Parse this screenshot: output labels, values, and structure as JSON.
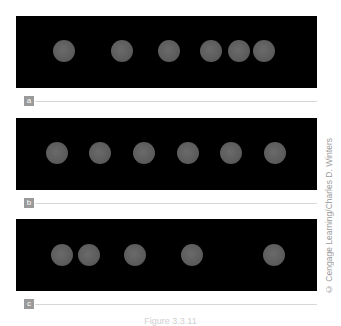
{
  "figure": {
    "panels": [
      {
        "label": "a",
        "top": 16,
        "coin_y": 35,
        "coins_x": [
          48,
          106,
          153,
          195,
          223,
          248
        ]
      },
      {
        "label": "b",
        "top": 118,
        "coin_y": 35,
        "coins_x": [
          41,
          84,
          128,
          172,
          215,
          259
        ]
      },
      {
        "label": "c",
        "top": 219,
        "coin_y": 36,
        "coins_x": [
          46,
          73,
          119,
          176,
          258
        ]
      }
    ],
    "credit": "© Cengage Learning/Charles D. Winters",
    "caption": "Figure 3.3.11",
    "colors": {
      "panel_bg": "#000000",
      "coin": "#5f5f5f",
      "label_box": "#9a9a9a",
      "rule": "#d8d8d8"
    }
  }
}
